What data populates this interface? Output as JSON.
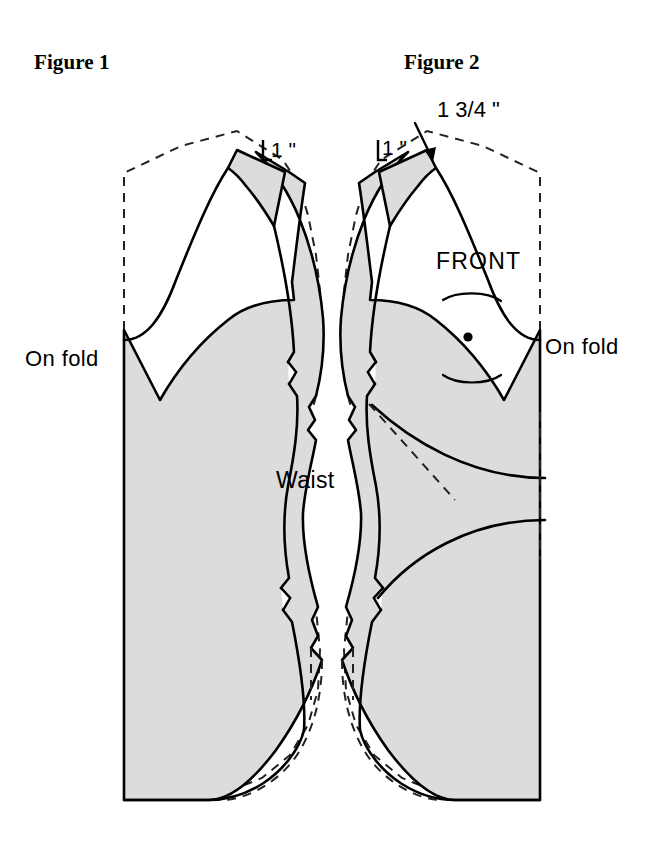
{
  "document": {
    "kind": "sewing-pattern-diagram",
    "background_color": "#ffffff"
  },
  "figures": [
    {
      "id": "figure-1",
      "title": "Figure 1",
      "labels": {
        "on_fold": "On fold",
        "dimension_shoulder": "1 \""
      }
    },
    {
      "id": "figure-2",
      "title": "Figure 2",
      "labels": {
        "on_fold": "On fold",
        "piece_name": "FRONT",
        "dimension_shoulder": "1 \"",
        "dimension_neck": "1 3/4 \""
      }
    }
  ],
  "shared_labels": {
    "waist": "Waist"
  },
  "style": {
    "piece_fill": "#dcdcdc",
    "outline_color": "#000000",
    "dashed_color": "#222222",
    "outline_width": 2.6,
    "dashed_width": 2.0,
    "marking_color": "#000000"
  },
  "markings": {
    "bust_point": "dot",
    "dart_arcs": 2,
    "arrow": "down-right-arrow"
  }
}
